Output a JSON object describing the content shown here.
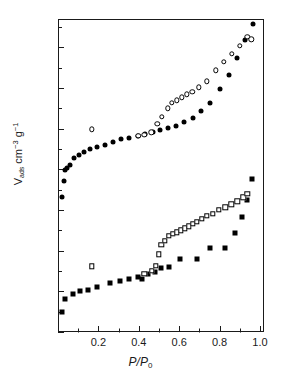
{
  "chart_data": {
    "type": "scatter",
    "title": "",
    "xlabel": "P/P0",
    "xlabel_parts": {
      "numerator": "P",
      "denominator": "P",
      "denominator_sub": "0"
    },
    "ylabel": "Vads cm-3 g-1",
    "ylabel_parts": {
      "symbol": "V",
      "symbol_sub": "ads",
      "unit1": "cm",
      "unit1_sup": "−3",
      "unit2": "g",
      "unit2_sup": "−1"
    },
    "xlim": [
      0.0,
      1.02
    ],
    "ylim": [
      0,
      154
    ],
    "x_major_ticks": [
      0.2,
      0.4,
      0.6,
      0.8,
      1.0
    ],
    "x_major_tick_labels": [
      "0.2",
      "0.4",
      "0.6",
      "0.8",
      "1.0"
    ],
    "x_minor_ticks": [
      0.1,
      0.3,
      0.5,
      0.7,
      0.9
    ],
    "y_major_ticks": [
      0,
      20,
      40,
      60,
      80,
      100,
      120,
      140
    ],
    "y_major_tick_labels": [
      "0",
      "20",
      "40",
      "60",
      "80",
      "100",
      "120",
      "140"
    ],
    "y_minor_ticks": [
      10,
      30,
      50,
      70,
      90,
      110,
      130,
      150
    ],
    "grid": false,
    "legend": false,
    "legend_position": "none",
    "marker_color": "#000000",
    "axis_color": "#1a1a1a",
    "background_color": "#ffffff",
    "series": [
      {
        "name": "Sample A adsorption",
        "marker": "filled-circle",
        "points": [
          [
            0.022,
            66.5
          ],
          [
            0.028,
            74.5
          ],
          [
            0.035,
            79.5
          ],
          [
            0.043,
            80.8
          ],
          [
            0.057,
            82.0
          ],
          [
            0.078,
            85.5
          ],
          [
            0.102,
            87.3
          ],
          [
            0.13,
            88.7
          ],
          [
            0.16,
            90.0
          ],
          [
            0.195,
            90.8
          ],
          [
            0.232,
            91.8
          ],
          [
            0.272,
            93.3
          ],
          [
            0.312,
            94.8
          ],
          [
            0.352,
            95.5
          ],
          [
            0.398,
            96.5
          ],
          [
            0.432,
            97.2
          ],
          [
            0.468,
            98.3
          ],
          [
            0.505,
            99.2
          ],
          [
            0.545,
            100.5
          ],
          [
            0.585,
            101.2
          ],
          [
            0.625,
            103.3
          ],
          [
            0.668,
            105.5
          ],
          [
            0.71,
            108.8
          ],
          [
            0.755,
            112.8
          ],
          [
            0.8,
            119.8
          ],
          [
            0.845,
            126.3
          ],
          [
            0.885,
            134.8
          ],
          [
            0.925,
            143.5
          ],
          [
            0.965,
            151.3
          ]
        ]
      },
      {
        "name": "Sample A desorption",
        "marker": "open-circle",
        "points": [
          [
            0.168,
            99.7
          ],
          [
            0.398,
            96.5
          ],
          [
            0.428,
            97.0
          ],
          [
            0.462,
            98.3
          ],
          [
            0.492,
            102.5
          ],
          [
            0.515,
            105.8
          ],
          [
            0.545,
            110.0
          ],
          [
            0.565,
            112.8
          ],
          [
            0.588,
            114.0
          ],
          [
            0.612,
            115.5
          ],
          [
            0.638,
            117.0
          ],
          [
            0.665,
            118.3
          ],
          [
            0.698,
            120.3
          ],
          [
            0.738,
            123.3
          ],
          [
            0.782,
            128.8
          ],
          [
            0.822,
            132.8
          ],
          [
            0.862,
            137.0
          ],
          [
            0.9,
            140.8
          ],
          [
            0.938,
            145.3
          ],
          [
            0.958,
            144.0
          ]
        ]
      },
      {
        "name": "Sample B adsorption",
        "marker": "filled-square",
        "points": [
          [
            0.018,
            9.8
          ],
          [
            0.035,
            16.3
          ],
          [
            0.072,
            18.5
          ],
          [
            0.108,
            20.0
          ],
          [
            0.148,
            20.8
          ],
          [
            0.192,
            22.3
          ],
          [
            0.258,
            24.3
          ],
          [
            0.305,
            25.3
          ],
          [
            0.352,
            26.3
          ],
          [
            0.398,
            27.0
          ],
          [
            0.418,
            26.3
          ],
          [
            0.448,
            28.3
          ],
          [
            0.478,
            29.3
          ],
          [
            0.512,
            31.5
          ],
          [
            0.548,
            31.8
          ],
          [
            0.605,
            36.0
          ],
          [
            0.688,
            36.0
          ],
          [
            0.752,
            41.5
          ],
          [
            0.825,
            41.5
          ],
          [
            0.878,
            48.8
          ],
          [
            0.912,
            56.8
          ],
          [
            0.935,
            65.0
          ],
          [
            0.962,
            75.3
          ]
        ]
      },
      {
        "name": "Sample B desorption",
        "marker": "open-square",
        "points": [
          [
            0.168,
            32.3
          ],
          [
            0.428,
            28.5
          ],
          [
            0.465,
            30.0
          ],
          [
            0.485,
            32.5
          ],
          [
            0.498,
            38.3
          ],
          [
            0.512,
            43.0
          ],
          [
            0.528,
            45.0
          ],
          [
            0.548,
            47.3
          ],
          [
            0.568,
            48.3
          ],
          [
            0.588,
            49.0
          ],
          [
            0.608,
            50.0
          ],
          [
            0.628,
            51.0
          ],
          [
            0.648,
            52.0
          ],
          [
            0.668,
            53.3
          ],
          [
            0.688,
            54.3
          ],
          [
            0.712,
            55.8
          ],
          [
            0.738,
            57.3
          ],
          [
            0.765,
            58.3
          ],
          [
            0.795,
            60.0
          ],
          [
            0.828,
            61.3
          ],
          [
            0.858,
            62.8
          ],
          [
            0.888,
            64.3
          ],
          [
            0.918,
            66.3
          ],
          [
            0.938,
            68.0
          ]
        ]
      }
    ]
  }
}
